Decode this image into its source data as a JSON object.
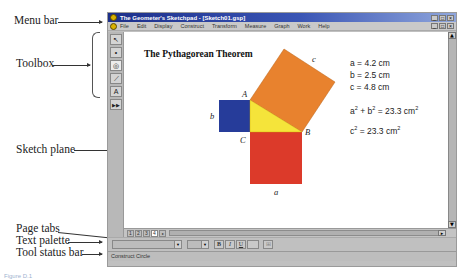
{
  "callouts": {
    "menu_bar": "Menu bar",
    "toolbox": "Toolbox",
    "sketch_plane": "Sketch plane",
    "page_tabs": "Page tabs",
    "text_palette": "Text palette",
    "tool_status_bar": "Tool status bar"
  },
  "caption": "Figure D.1",
  "window": {
    "title": "The Geometer's Sketchpad - [Sketch01.gsp]",
    "title_buttons": [
      "_",
      "□",
      "×"
    ],
    "doc_buttons": [
      "_",
      "□",
      "×"
    ]
  },
  "menubar": {
    "items": [
      "File",
      "Edit",
      "Display",
      "Construct",
      "Transform",
      "Measure",
      "Graph",
      "Work",
      "Help"
    ]
  },
  "toolbox": {
    "tools": [
      {
        "name": "selection-arrow-tool",
        "glyph": "↖"
      },
      {
        "name": "point-tool",
        "glyph": "•"
      },
      {
        "name": "compass-tool",
        "glyph": "◎"
      },
      {
        "name": "straightedge-tool",
        "glyph": "⟋"
      },
      {
        "name": "text-tool",
        "glyph": "A"
      },
      {
        "name": "custom-tool",
        "glyph": "▶▶"
      }
    ],
    "active_index": 2
  },
  "sketch": {
    "title": "The Pythagorean Theorem",
    "vertices": {
      "A": "A",
      "B": "B",
      "C": "C"
    },
    "sides": {
      "a": "a",
      "b": "b",
      "c": "c"
    },
    "colors": {
      "square_c": "#e8822e",
      "square_b": "#263c9a",
      "square_a": "#dc3a2a",
      "triangle": "#f5e43a"
    },
    "measurements": {
      "a": "a = 4.2 cm",
      "b": "b = 2.5 cm",
      "c": "c = 4.8 cm",
      "sum_lhs_a": "a",
      "sum_lhs_plus": " + b",
      "sum_rhs": " = 23.3 cm",
      "c2_lhs": "c",
      "c2_rhs": " = 23.3 cm",
      "exp": "2"
    }
  },
  "page_tabs": {
    "tabs": [
      "1",
      "2",
      "3",
      "4"
    ],
    "active_index": 3
  },
  "text_palette": {
    "font_value": "",
    "size_value": "",
    "bold": "B",
    "italic": "I",
    "underline": "U",
    "color_label": "",
    "extra": "⊞"
  },
  "status_bar": {
    "text": "Construct Circle"
  }
}
